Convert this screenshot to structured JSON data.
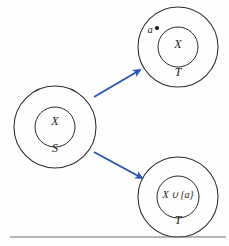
{
  "figure": {
    "type": "set-diagram",
    "background_color": "#fefefe",
    "outline_color": "#2b2b2b",
    "arrow_color": "#2255bb",
    "text_color": "#1a1a1a",
    "rule_color": "#6e6e6e"
  },
  "source_set": {
    "outer_label": "S",
    "inner_label": "X",
    "center": {
      "x": 55,
      "y": 127
    },
    "outer_radius": 41,
    "inner_radius": 20,
    "inner_label_pos": {
      "x": 55,
      "y": 125
    },
    "outer_label_pos": {
      "x": 55,
      "y": 152
    }
  },
  "target_sets": [
    {
      "name": "target-top",
      "outer_label": "T",
      "inner_label": "X",
      "element_label": "a",
      "has_element_dot": true,
      "center": {
        "x": 178,
        "y": 47
      },
      "outer_radius": 40,
      "inner_radius": 20,
      "inner_label_pos": {
        "x": 178,
        "y": 48
      },
      "outer_label_pos": {
        "x": 178,
        "y": 76
      },
      "element_label_pos": {
        "x": 150,
        "y": 33
      },
      "element_dot_pos": {
        "x": 157,
        "y": 28
      },
      "element_dot_radius": 2.1
    },
    {
      "name": "target-bottom",
      "outer_label": "T",
      "inner_label": "X ∪ {a}",
      "element_label": null,
      "has_element_dot": false,
      "center": {
        "x": 178,
        "y": 197
      },
      "outer_radius": 40,
      "inner_radius": 21,
      "inner_label_pos": {
        "x": 178,
        "y": 198
      },
      "outer_label_pos": {
        "x": 178,
        "y": 224
      },
      "element_label_pos": null,
      "element_dot_pos": null,
      "element_dot_radius": 0
    }
  ],
  "arrows": [
    {
      "name": "arrow-to-top",
      "from": {
        "x": 94,
        "y": 97
      },
      "to": {
        "x": 140,
        "y": 70
      },
      "color": "#2255bb",
      "width": 1.9
    },
    {
      "name": "arrow-to-bottom",
      "from": {
        "x": 94,
        "y": 152
      },
      "to": {
        "x": 142,
        "y": 178
      },
      "color": "#2255bb",
      "width": 1.9
    }
  ],
  "baseline_rule": {
    "x1": 10,
    "y1": 237,
    "x2": 226,
    "y2": 237
  }
}
